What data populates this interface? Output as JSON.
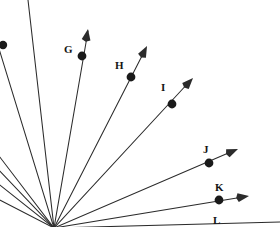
{
  "figure": {
    "type": "ray-fan-diagram",
    "width": 280,
    "height": 227,
    "background_color": "#ffffff",
    "line_color": "#2b2b2b",
    "dot_color": "#1a1a1a",
    "label_color": "#141414",
    "origin": {
      "x": 54,
      "y": 228
    }
  },
  "rays": [
    {
      "id": "ray-a",
      "label": "",
      "label_visible": false,
      "line": {
        "x1": 54,
        "y1": 228,
        "x2": -4,
        "y2": 39
      },
      "dot": {
        "x": 3,
        "y": 45,
        "r": 4.2,
        "visible": true
      },
      "arrow": {
        "visible": false,
        "x": -4,
        "y": 39,
        "angle": 253
      }
    },
    {
      "id": "ray-b",
      "label": "",
      "label_visible": false,
      "line": {
        "x1": 54,
        "y1": 228,
        "x2": 28,
        "y2": 0
      },
      "dot": {
        "x": 0,
        "y": 0,
        "r": 0,
        "visible": false
      },
      "arrow": {
        "visible": false,
        "x": 28,
        "y": 0,
        "angle": 263
      }
    },
    {
      "id": "ray-g",
      "label": "G",
      "label_visible": true,
      "label_pos": {
        "x": 64,
        "y": 44
      },
      "line": {
        "x1": 54,
        "y1": 228,
        "x2": 88,
        "y2": 31
      },
      "dot": {
        "x": 82,
        "y": 56,
        "r": 4.4,
        "visible": true
      },
      "arrow": {
        "visible": true,
        "x": 88,
        "y": 29,
        "angle": 280
      }
    },
    {
      "id": "ray-h",
      "label": "H",
      "label_visible": true,
      "label_pos": {
        "x": 115,
        "y": 60
      },
      "line": {
        "x1": 54,
        "y1": 228,
        "x2": 145,
        "y2": 50
      },
      "dot": {
        "x": 131,
        "y": 77,
        "r": 4.4,
        "visible": true
      },
      "arrow": {
        "visible": true,
        "x": 147,
        "y": 46,
        "angle": 297
      }
    },
    {
      "id": "ray-i",
      "label": "I",
      "label_visible": true,
      "label_pos": {
        "x": 161,
        "y": 82
      },
      "line": {
        "x1": 54,
        "y1": 228,
        "x2": 190,
        "y2": 81
      },
      "dot": {
        "x": 172,
        "y": 104,
        "r": 4.4,
        "visible": true
      },
      "arrow": {
        "visible": true,
        "x": 193,
        "y": 78,
        "angle": 313
      }
    },
    {
      "id": "ray-j",
      "label": "J",
      "label_visible": true,
      "label_pos": {
        "x": 203,
        "y": 144
      },
      "line": {
        "x1": 54,
        "y1": 228,
        "x2": 233,
        "y2": 151
      },
      "dot": {
        "x": 209,
        "y": 163,
        "r": 4.4,
        "visible": true
      },
      "arrow": {
        "visible": true,
        "x": 238,
        "y": 149,
        "angle": 337
      }
    },
    {
      "id": "ray-k",
      "label": "K",
      "label_visible": true,
      "label_pos": {
        "x": 215,
        "y": 182
      },
      "line": {
        "x1": 54,
        "y1": 228,
        "x2": 243,
        "y2": 197
      },
      "dot": {
        "x": 219,
        "y": 200,
        "r": 4.4,
        "visible": true
      },
      "arrow": {
        "visible": true,
        "x": 249,
        "y": 196,
        "angle": 351
      }
    },
    {
      "id": "ray-l",
      "label": "L",
      "label_visible": true,
      "label_pos": {
        "x": 213,
        "y": 215
      },
      "line": {
        "x1": 54,
        "y1": 228,
        "x2": 280,
        "y2": 222
      },
      "dot": {
        "x": 0,
        "y": 0,
        "r": 0,
        "visible": false
      },
      "arrow": {
        "visible": false,
        "x": 280,
        "y": 222,
        "angle": 358
      }
    },
    {
      "id": "ray-c",
      "label": "",
      "label_visible": false,
      "line": {
        "x1": 54,
        "y1": 228,
        "x2": -4,
        "y2": 152
      },
      "dot": {
        "x": 0,
        "y": 0,
        "r": 0,
        "visible": false
      },
      "arrow": {
        "visible": false,
        "x": -4,
        "y": 152,
        "angle": 232
      }
    },
    {
      "id": "ray-d",
      "label": "",
      "label_visible": false,
      "line": {
        "x1": 54,
        "y1": 228,
        "x2": -4,
        "y2": 167
      },
      "dot": {
        "x": 0,
        "y": 0,
        "r": 0,
        "visible": false
      },
      "arrow": {
        "visible": false,
        "x": -4,
        "y": 167,
        "angle": 226
      }
    },
    {
      "id": "ray-e",
      "label": "",
      "label_visible": false,
      "line": {
        "x1": 54,
        "y1": 228,
        "x2": -4,
        "y2": 182
      },
      "dot": {
        "x": 0,
        "y": 0,
        "r": 0,
        "visible": false
      },
      "arrow": {
        "visible": false,
        "x": -4,
        "y": 182,
        "angle": 219
      }
    },
    {
      "id": "ray-f",
      "label": "",
      "label_visible": false,
      "line": {
        "x1": 54,
        "y1": 228,
        "x2": -4,
        "y2": 198
      },
      "dot": {
        "x": 0,
        "y": 0,
        "r": 0,
        "visible": false
      },
      "arrow": {
        "visible": false,
        "x": -4,
        "y": 198,
        "angle": 211
      }
    }
  ]
}
